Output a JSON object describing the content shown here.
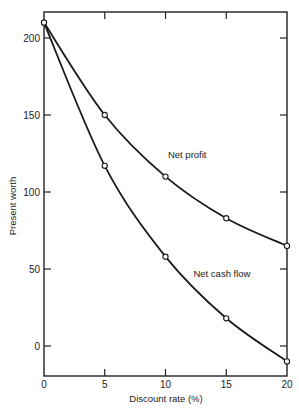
{
  "chart_data": {
    "type": "line",
    "title": "",
    "xlabel": "Discount rate (%)",
    "ylabel": "Present worth",
    "x": [
      0,
      5,
      10,
      15,
      20
    ],
    "xlim": [
      0,
      20
    ],
    "ylim": [
      -20,
      220
    ],
    "xticks": [
      0,
      5,
      10,
      15,
      20
    ],
    "yticks": [
      0,
      50,
      100,
      150,
      200
    ],
    "grid": false,
    "legend": "none (inline curve labels)",
    "series": [
      {
        "name": "Net profit",
        "values": [
          210,
          150,
          110,
          83,
          65
        ],
        "marker": "open-circle"
      },
      {
        "name": "Net cash flow",
        "values": [
          210,
          117,
          58,
          18,
          -10
        ],
        "marker": "open-circle"
      }
    ],
    "annotations": [
      {
        "text": "Net profit",
        "x": 10.2,
        "y": 122
      },
      {
        "text": "Net cash flow",
        "x": 12.3,
        "y": 45
      }
    ]
  }
}
